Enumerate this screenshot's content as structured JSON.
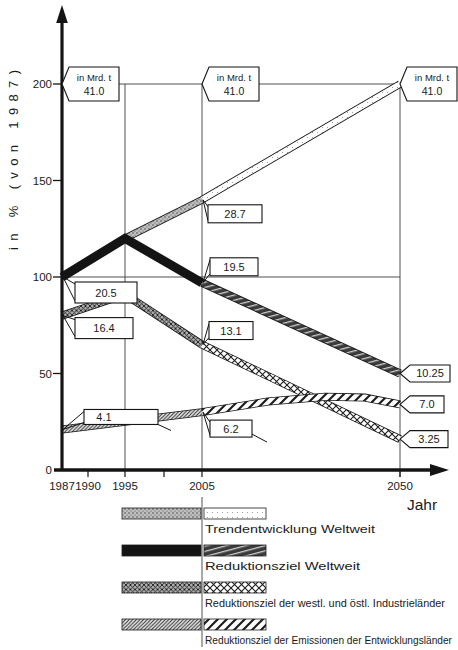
{
  "figure": {
    "background": "#ffffff",
    "ink": "#141414"
  },
  "chart_data": {
    "type": "line",
    "title": "",
    "ylabel": "in % (von 1987)",
    "xlabel": "Jahr",
    "ylim": [
      0,
      215
    ],
    "grid": "reference lines at 100% and 200%, verticals at 1995, 2005, 2050",
    "legend_position": "bottom",
    "unit_note": "flags give absolute values in Mrd. t; 100% = 20.5 Mrd. t (1987), 200% = 41.0 Mrd. t",
    "y_ticks": [
      {
        "label": "0",
        "pct": 0
      },
      {
        "label": "50",
        "pct": 50
      },
      {
        "label": "100",
        "pct": 100
      },
      {
        "label": "150",
        "pct": 150
      },
      {
        "label": "200",
        "pct": 200
      }
    ],
    "x_ticks": [
      {
        "label": "1987",
        "year": 1987
      },
      {
        "label": "1990",
        "year": 1990
      },
      {
        "label": "1995",
        "year": 1995
      },
      {
        "label": "",
        "year": 2000
      },
      {
        "label": "2005",
        "year": 2005
      },
      {
        "label": "2050",
        "year": 2050
      }
    ],
    "reference_lines": {
      "horizontal_pct": [
        200,
        100
      ],
      "vertical_years": [
        1995,
        2005,
        2050
      ]
    },
    "series": [
      {
        "name": "Trendentwicklung Weltweit",
        "style": "trend",
        "points_pct": [
          [
            1987,
            100
          ],
          [
            1995,
            120
          ],
          [
            2005,
            140
          ],
          [
            2050,
            200
          ]
        ],
        "values_mrd_t": [
          {
            "year": 1987,
            "value": 20.5
          },
          {
            "year": 2005,
            "value": 28.7
          },
          {
            "year": 2050,
            "value": 41.0
          }
        ]
      },
      {
        "name": "Reduktionsziel Weltweit",
        "style": "target",
        "points_pct": [
          [
            1987,
            100
          ],
          [
            1995,
            120
          ],
          [
            2005,
            97
          ],
          [
            2050,
            50
          ]
        ],
        "values_mrd_t": [
          {
            "year": 1987,
            "value": 20.5
          },
          {
            "year": 2005,
            "value": 19.5
          },
          {
            "year": 2050,
            "value": 10.25
          }
        ]
      },
      {
        "name": "Reduktionsziel der westl. und östl. Industrieländer",
        "style": "ind",
        "points_pct": [
          [
            1987,
            80
          ],
          [
            1995,
            91
          ],
          [
            2005,
            65
          ],
          [
            2050,
            16
          ]
        ],
        "values_mrd_t": [
          {
            "year": 1987,
            "value": 16.4
          },
          {
            "year": 2005,
            "value": 13.1
          },
          {
            "year": 2050,
            "value": 3.25
          }
        ]
      },
      {
        "name": "Reduktionsziel der Emissionen der Entwicklungsländer",
        "style": "dev",
        "points_pct": [
          [
            1987,
            21
          ],
          [
            1995,
            25
          ],
          [
            2005,
            30
          ],
          [
            2020,
            35.5
          ],
          [
            2033,
            38
          ],
          [
            2042,
            37.5
          ],
          [
            2050,
            34
          ]
        ],
        "values_mrd_t": [
          {
            "year": 1987,
            "value": 4.1
          },
          {
            "year": 2005,
            "value": 6.2
          },
          {
            "year": 2050,
            "value": 7.0
          }
        ]
      }
    ]
  },
  "annotations": [
    {
      "kind": "pennant2",
      "line1": "in Mrd. t",
      "line2": "41.0",
      "at": "axis",
      "pct": 200
    },
    {
      "kind": "pennant2",
      "line1": "in Mrd. t",
      "line2": "41.0",
      "at": 2005,
      "pct": 200
    },
    {
      "kind": "pennant2",
      "line1": "in Mrd. t",
      "line2": "41.0",
      "at": 2050,
      "pct": 200
    },
    {
      "kind": "tag",
      "label": "20.5",
      "year": 1987,
      "pct": 100,
      "box": {
        "dx": 13,
        "dy": 5,
        "w": 62,
        "h": 21
      }
    },
    {
      "kind": "tag",
      "label": "16.4",
      "year": 1987,
      "pct": 80,
      "box": {
        "dx": 13,
        "dy": 2,
        "w": 58,
        "h": 21
      }
    },
    {
      "kind": "tag",
      "label": "4.1",
      "year": 1987,
      "pct": 21,
      "box": {
        "dx": 22,
        "dy": -20,
        "w": 74,
        "h": 15,
        "text_dx": 20
      },
      "fold": true
    },
    {
      "kind": "tag",
      "label": "28.7",
      "year": 2005,
      "pct": 140,
      "box": {
        "dx": 6,
        "dy": 5,
        "w": 54,
        "h": 18
      }
    },
    {
      "kind": "tag",
      "label": "19.5",
      "year": 2005,
      "pct": 97,
      "box": {
        "dx": 8,
        "dy": -25,
        "w": 48,
        "h": 18
      }
    },
    {
      "kind": "tag",
      "label": "13.1",
      "year": 2005,
      "pct": 65,
      "box": {
        "dx": 7,
        "dy": -23,
        "w": 44,
        "h": 18
      }
    },
    {
      "kind": "tag",
      "label": "6.2",
      "year": 2005,
      "pct": 30,
      "box": {
        "dx": 8,
        "dy": 8,
        "w": 42,
        "h": 17
      },
      "leader": true
    },
    {
      "kind": "pennant",
      "label": "10.25",
      "year": 2050,
      "pct": 50,
      "w": 40
    },
    {
      "kind": "pennant",
      "label": "7.0",
      "year": 2050,
      "pct": 34,
      "w": 34
    },
    {
      "kind": "pennant",
      "label": "3.25",
      "year": 2050,
      "pct": 16,
      "w": 38
    }
  ],
  "legend": {
    "items": [
      {
        "label": "Trendentwicklung Weltweit",
        "style": "trend"
      },
      {
        "label": "Reduktionsziel Weltweit",
        "style": "target"
      },
      {
        "label": "Reduktionsziel der westl. und östl. Industrieländer",
        "style": "ind"
      },
      {
        "label": "Reduktionsziel der Emissionen der Entwicklungsländer",
        "style": "dev"
      }
    ]
  }
}
